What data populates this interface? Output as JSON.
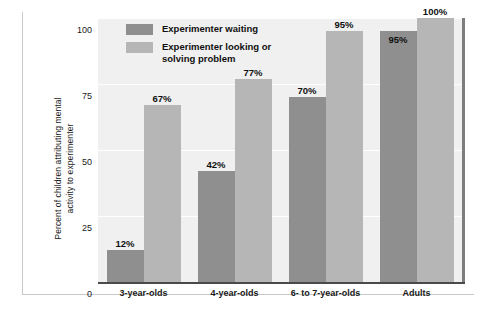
{
  "chart_data": {
    "type": "bar",
    "title": "",
    "subtitle": "",
    "xlabel": "",
    "ylabel": "Percent of children attributing mental\nactivity to experimenter",
    "ylabel_line1": "Percent of children attributing mental",
    "ylabel_line2": "activity to experimenter",
    "categories": [
      "3-year-olds",
      "4-year-olds",
      "6- to 7-year-olds",
      "Adults"
    ],
    "series": [
      {
        "name": "Experimenter waiting",
        "color": "#8f8f8f",
        "values": [
          12,
          42,
          70,
          95
        ],
        "labels": [
          "12%",
          "42%",
          "70%",
          "95%"
        ]
      },
      {
        "name": "Experimenter looking or solving problem",
        "legend_text": "Experimenter looking or\nsolving problem",
        "color": "#b6b6b6",
        "values": [
          67,
          77,
          95,
          100
        ],
        "labels": [
          "67%",
          "77%",
          "95%",
          "100%"
        ]
      }
    ],
    "ylim": [
      0,
      100
    ],
    "yticks": [
      0,
      25,
      50,
      75,
      100
    ],
    "ytick_labels": [
      "0",
      "25",
      "50",
      "75",
      "100"
    ],
    "grid": true,
    "grid_color": "#ffffff",
    "plot_background": "#f0f0f0",
    "legend_position": "top-left"
  }
}
